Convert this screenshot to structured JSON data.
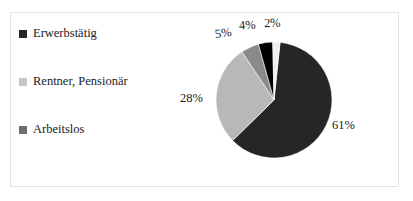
{
  "chart_data": {
    "type": "pie",
    "title": "",
    "categories": [
      "Erwerbstätig",
      "Rentner, Pensionär",
      "Arbeitslos",
      "",
      ""
    ],
    "values": [
      61,
      28,
      5,
      4,
      2
    ],
    "labels": [
      "61%",
      "28%",
      "5%",
      "4%",
      "2%"
    ],
    "colors": [
      "#262626",
      "#b8b8b8",
      "#8a8a8a",
      "#000000",
      "#f0f0f0"
    ],
    "legend_position": "left",
    "grid": false,
    "slices": [
      {
        "label": "61%",
        "value": 61,
        "color": "#262626",
        "name": "Erwerbstätig"
      },
      {
        "label": "28%",
        "value": 28,
        "color": "#b8b8b8",
        "name": "Rentner, Pensionär"
      },
      {
        "label": "5%",
        "value": 5,
        "color": "#8a8a8a",
        "name": "Arbeitslos"
      },
      {
        "label": "4%",
        "value": 4,
        "color": "#000000",
        "name": ""
      },
      {
        "label": "2%",
        "value": 2,
        "color": "#f0f0f0",
        "name": ""
      }
    ]
  },
  "legend": {
    "items": [
      {
        "label": "Erwerbstätig",
        "color": "#262626"
      },
      {
        "label": "Rentner, Pensionär",
        "color": "#b8b8b8"
      },
      {
        "label": "Arbeitslos",
        "color": "#6e6e6e"
      }
    ]
  },
  "labels": {
    "pct_61": "61%",
    "pct_28": "28%",
    "pct_5": "5%",
    "pct_4": "4%",
    "pct_2": "2%"
  },
  "frame": {
    "border_color": "#e3e3e3",
    "background": "#ffffff"
  }
}
